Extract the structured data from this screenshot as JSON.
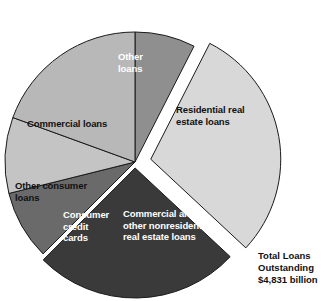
{
  "chart_data": {
    "type": "pie",
    "title": "",
    "total_label_lines": [
      "Total Loans",
      "Outstanding",
      "$4,831 billion"
    ],
    "total_value": 4831,
    "total_units": "billion dollars",
    "legend": "none",
    "labels_inside_slices": true,
    "categories": [
      "Other loans",
      "Residential real estate loans",
      "Commercial and other nonresidential real estate loans",
      "Consumer credit cards",
      "Other consumer loans",
      "Commercial loans"
    ],
    "values": [
      7.5,
      29.5,
      25.5,
      8.5,
      9.5,
      19.5
    ],
    "value_unit": "percent of total",
    "colors": [
      "#8f8f8f",
      "#d8d8d8",
      "#3a3a3a",
      "#6a6a6a",
      "#c4c4c4",
      "#b8b8b8"
    ],
    "slices": [
      {
        "name": "other-loans",
        "label": "Other\nloans",
        "label_text": "Other loans",
        "start_angle": 0,
        "end_angle": 27,
        "value": 7.5,
        "color": "#8f8f8f",
        "text_color": "#ffffff",
        "exploded": false
      },
      {
        "name": "residential-real-estate-loans",
        "label": "Residential real\nestate loans",
        "label_text": "Residential real estate loans",
        "start_angle": 27,
        "end_angle": 133,
        "value": 29.5,
        "color": "#d8d8d8",
        "text_color": "#111111",
        "exploded": true,
        "explode_offset": 16
      },
      {
        "name": "commercial-other-nonresidential-real-estate-loans",
        "label": "Commercial and\nother nonresidential\nreal estate loans",
        "label_text": "Commercial and other nonresidential real estate loans",
        "start_angle": 133,
        "end_angle": 225,
        "value": 25.5,
        "color": "#3a3a3a",
        "text_color": "#ffffff",
        "exploded": true,
        "explode_offset": 6
      },
      {
        "name": "consumer-credit-cards",
        "label": "Consumer\ncredit\ncards",
        "label_text": "Consumer credit cards",
        "start_angle": 225,
        "end_angle": 256,
        "value": 8.5,
        "color": "#6a6a6a",
        "text_color": "#ffffff",
        "exploded": false
      },
      {
        "name": "other-consumer-loans",
        "label": "Other consumer\nloans",
        "label_text": "Other consumer loans",
        "start_angle": 256,
        "end_angle": 290,
        "value": 9.5,
        "color": "#c4c4c4",
        "text_color": "#111111",
        "exploded": false
      },
      {
        "name": "commercial-loans",
        "label": "Commercial loans",
        "label_text": "Commercial loans",
        "start_angle": 290,
        "end_angle": 360,
        "value": 19.5,
        "color": "#b8b8b8",
        "text_color": "#111111",
        "exploded": false
      }
    ],
    "geometry": {
      "center_x": 135,
      "center_y": 162,
      "radius": 130,
      "stroke_color": "#1a1a1a",
      "background": "#ffffff"
    }
  },
  "summary": {
    "line1": "Total Loans",
    "line2": "Outstanding",
    "line3": "$4,831 billion"
  }
}
